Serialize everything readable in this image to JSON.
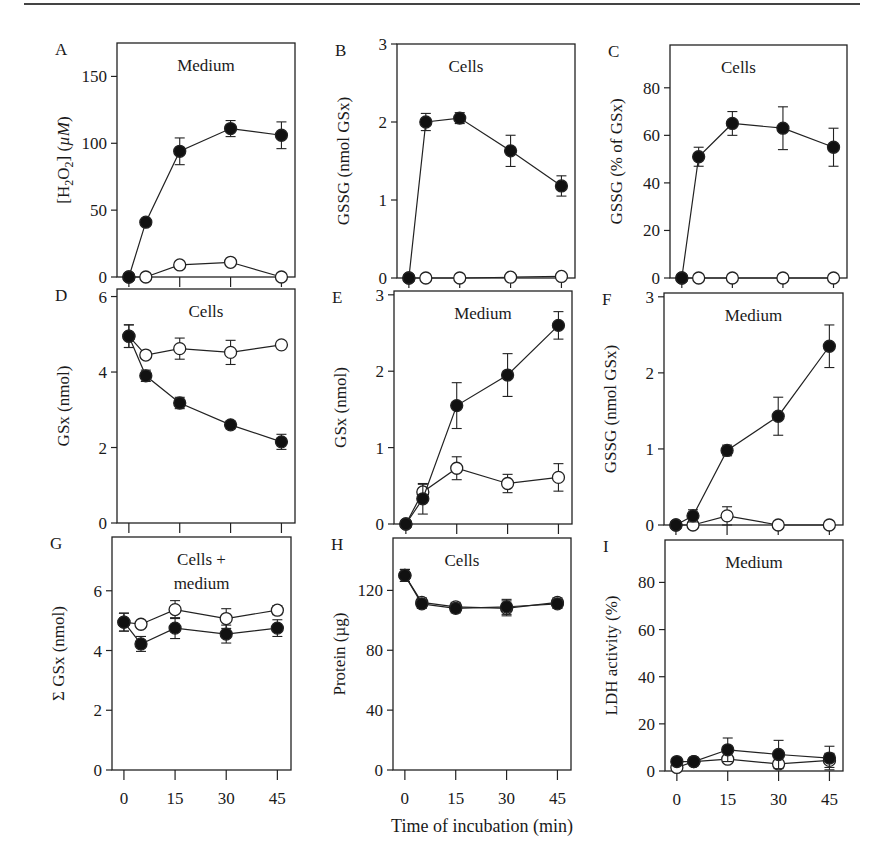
{
  "figure": {
    "shared_xlabel": "Time of incubation (min)",
    "x_ticks": [
      0,
      15,
      30,
      45
    ],
    "series_legend": [
      {
        "name": "filled",
        "marker": "filled-circle",
        "color": "#111111"
      },
      {
        "name": "open",
        "marker": "open-circle",
        "color": "#111111"
      }
    ]
  },
  "chart_data": [
    {
      "panel": "A",
      "type": "line",
      "annotation": "Medium",
      "ylabel": "[H2O2] (µM)",
      "ylim": [
        0,
        175
      ],
      "yticks": [
        0,
        50,
        100,
        150
      ],
      "x": [
        0,
        5,
        15,
        30,
        45
      ],
      "series": [
        {
          "name": "filled",
          "values": [
            0,
            41,
            94,
            111,
            106
          ],
          "err": [
            0,
            0,
            10,
            6,
            10
          ]
        },
        {
          "name": "open",
          "values": [
            0,
            0,
            9,
            11,
            0
          ],
          "err": [
            0,
            0,
            0,
            0,
            0
          ]
        }
      ],
      "box": {
        "left": 117,
        "top": 43,
        "right": 295,
        "bottom": 277
      },
      "show_xtick_labels": false
    },
    {
      "panel": "B",
      "type": "line",
      "annotation": "Cells",
      "ylabel": "GSSG (nmol GSx)",
      "ylim": [
        0,
        3
      ],
      "yticks": [
        0,
        1,
        2,
        3
      ],
      "x": [
        0,
        5,
        15,
        30,
        45
      ],
      "series": [
        {
          "name": "filled",
          "values": [
            0,
            2.0,
            2.05,
            1.63,
            1.18
          ],
          "err": [
            0,
            0.11,
            0.07,
            0.2,
            0.13
          ]
        },
        {
          "name": "open",
          "values": [
            0,
            0,
            0,
            0.01,
            0.02
          ],
          "err": [
            0,
            0,
            0,
            0,
            0
          ]
        }
      ],
      "box": {
        "left": 397,
        "top": 44,
        "right": 575,
        "bottom": 278
      },
      "show_xtick_labels": false
    },
    {
      "panel": "C",
      "type": "line",
      "annotation": "Cells",
      "ylabel": "GSSG (% of GSx)",
      "ylim": [
        0,
        98
      ],
      "yticks": [
        0,
        20,
        40,
        60,
        80
      ],
      "x": [
        0,
        5,
        15,
        30,
        45
      ],
      "series": [
        {
          "name": "filled",
          "values": [
            0,
            51,
            65,
            63,
            55
          ],
          "err": [
            0,
            4,
            5,
            9,
            8
          ]
        },
        {
          "name": "open",
          "values": [
            0,
            0,
            0,
            0,
            0
          ],
          "err": [
            0,
            0,
            0,
            0,
            0
          ]
        }
      ],
      "box": {
        "left": 670,
        "top": 45,
        "right": 847,
        "bottom": 278
      },
      "show_xtick_labels": false
    },
    {
      "panel": "D",
      "type": "line",
      "annotation": "Cells",
      "ylabel": "GSx (nmol)",
      "ylim": [
        0,
        6.2
      ],
      "yticks": [
        0,
        2,
        4,
        6
      ],
      "x": [
        0,
        5,
        15,
        30,
        45
      ],
      "series": [
        {
          "name": "filled",
          "values": [
            4.95,
            3.9,
            3.18,
            2.6,
            2.15
          ],
          "err": [
            0.3,
            0.15,
            0.15,
            0.1,
            0.2
          ]
        },
        {
          "name": "open",
          "values": [
            4.95,
            4.45,
            4.62,
            4.52,
            4.72
          ],
          "err": [
            0.3,
            0,
            0.28,
            0.32,
            0
          ]
        }
      ],
      "box": {
        "left": 117,
        "top": 289,
        "right": 295,
        "bottom": 523
      },
      "show_xtick_labels": false
    },
    {
      "panel": "E",
      "type": "line",
      "annotation": "Medium",
      "ylabel": "GSx (nmol)",
      "ylim": [
        0,
        3.05
      ],
      "yticks": [
        0,
        1,
        2,
        3
      ],
      "x": [
        0,
        5,
        15,
        30,
        45
      ],
      "series": [
        {
          "name": "filled",
          "values": [
            0,
            0.33,
            1.55,
            1.95,
            2.6
          ],
          "err": [
            0,
            0.2,
            0.3,
            0.28,
            0.18
          ]
        },
        {
          "name": "open",
          "values": [
            0,
            0.42,
            0.73,
            0.53,
            0.61
          ],
          "err": [
            0,
            0.1,
            0.15,
            0.12,
            0.18
          ]
        }
      ],
      "box": {
        "left": 394,
        "top": 291,
        "right": 572,
        "bottom": 524
      },
      "show_xtick_labels": false
    },
    {
      "panel": "F",
      "type": "line",
      "annotation": "Medium",
      "ylabel": "GSSG (nmol GSx)",
      "ylim": [
        0,
        3.05
      ],
      "yticks": [
        0,
        1,
        2,
        3
      ],
      "x": [
        0,
        5,
        15,
        30,
        45
      ],
      "series": [
        {
          "name": "filled",
          "values": [
            0,
            0.12,
            0.98,
            1.43,
            2.35
          ],
          "err": [
            0,
            0.08,
            0.07,
            0.25,
            0.28
          ]
        },
        {
          "name": "open",
          "values": [
            0,
            0,
            0.12,
            0,
            0
          ],
          "err": [
            0,
            0,
            0.12,
            0,
            0
          ]
        }
      ],
      "box": {
        "left": 664,
        "top": 293,
        "right": 843,
        "bottom": 525
      },
      "show_xtick_labels": false
    },
    {
      "panel": "G",
      "type": "line",
      "annotation": "Cells +\nmedium",
      "ylabel": "Σ GSx (nmol)",
      "ylim": [
        0,
        7.8
      ],
      "yticks": [
        0,
        2,
        4,
        6
      ],
      "x": [
        0,
        5,
        15,
        30,
        45
      ],
      "series": [
        {
          "name": "filled",
          "values": [
            4.95,
            4.22,
            4.75,
            4.55,
            4.75
          ],
          "err": [
            0.3,
            0.25,
            0.35,
            0.3,
            0.28
          ]
        },
        {
          "name": "open",
          "values": [
            4.95,
            4.88,
            5.37,
            5.07,
            5.35
          ],
          "err": [
            0.3,
            0,
            0.3,
            0.33,
            0.15
          ]
        }
      ],
      "box": {
        "left": 112,
        "top": 537,
        "right": 291,
        "bottom": 770
      },
      "show_xtick_labels": true
    },
    {
      "panel": "H",
      "type": "line",
      "annotation": "Cells",
      "ylabel": "Protein (µg)",
      "ylim": [
        0,
        155
      ],
      "yticks": [
        0,
        40,
        80,
        120
      ],
      "x": [
        0,
        5,
        15,
        30,
        45
      ],
      "series": [
        {
          "name": "filled",
          "values": [
            130,
            111,
            108,
            109,
            111
          ],
          "err": [
            4,
            3,
            3,
            5,
            3
          ]
        },
        {
          "name": "open",
          "values": [
            130,
            112,
            109,
            108,
            112
          ],
          "err": [
            4,
            3,
            3,
            5,
            3
          ]
        }
      ],
      "box": {
        "left": 393,
        "top": 538,
        "right": 571,
        "bottom": 770
      },
      "show_xtick_labels": true
    },
    {
      "panel": "I",
      "type": "line",
      "annotation": "Medium",
      "ylabel": "LDH activity (%)",
      "ylim": [
        0,
        98
      ],
      "yticks": [
        0,
        20,
        40,
        60,
        80
      ],
      "x": [
        0,
        5,
        15,
        30,
        45
      ],
      "series": [
        {
          "name": "filled",
          "values": [
            4,
            4,
            9,
            7,
            5.5
          ],
          "err": [
            0,
            0,
            5,
            6,
            5
          ]
        },
        {
          "name": "open",
          "values": [
            1.5,
            4,
            5,
            3,
            4.5
          ],
          "err": [
            0,
            0,
            0,
            0,
            3
          ]
        }
      ],
      "box": {
        "left": 665,
        "top": 540,
        "right": 843,
        "bottom": 771
      },
      "show_xtick_labels": true
    }
  ]
}
